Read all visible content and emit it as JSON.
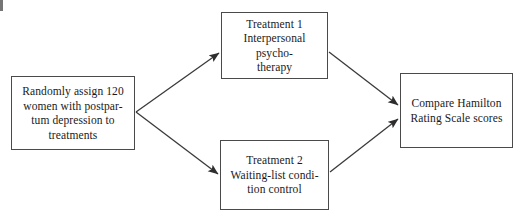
{
  "diagram": {
    "canvas": {
      "width": 528,
      "height": 223,
      "background": "#ffffff"
    },
    "line_color": "#3a3a3a",
    "border_color": "#4a4a4a",
    "text_color": "#1a1a1a",
    "boxes": [
      {
        "id": "randomize",
        "name": "randomly-assign-box",
        "text": "Randomly assign 120\nwomen with postpar-\ntum depression to\ntreatments"
      },
      {
        "id": "treatment_1",
        "name": "treatment-1-box",
        "text": "Treatment 1\nInterpersonal psycho-\ntherapy"
      },
      {
        "id": "treatment_2",
        "name": "treatment-2-box",
        "text": "Treatment 2\nWaiting-list condi-\ntion control"
      },
      {
        "id": "compare",
        "name": "compare-outcome-box",
        "text": "Compare Hamilton\nRating Scale scores"
      }
    ],
    "arrows": [
      {
        "id": "assign-to-treatment-1",
        "from": "randomize",
        "to": "treatment_1"
      },
      {
        "id": "assign-to-treatment-2",
        "from": "randomize",
        "to": "treatment_2"
      },
      {
        "id": "treatment-1-to-compare",
        "from": "treatment_1",
        "to": "compare"
      },
      {
        "id": "treatment-2-to-compare",
        "from": "treatment_2",
        "to": "compare"
      }
    ]
  }
}
